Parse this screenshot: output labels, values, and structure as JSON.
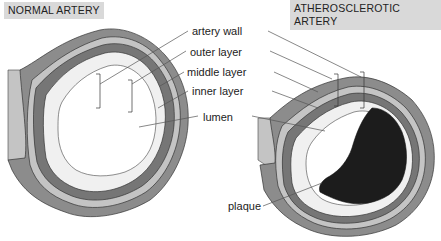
{
  "diagram": {
    "titles": {
      "left": "NORMAL ARTERY",
      "right": "ATHEROSCLEROTIC ARTERY"
    },
    "labels": {
      "artery_wall": "artery wall",
      "outer_layer": "outer layer",
      "middle_layer": "middle layer",
      "inner_layer": "inner layer",
      "lumen": "lumen",
      "plaque": "plaque"
    },
    "colors": {
      "outer_layer": "#8c8c8c",
      "middle_layer_light": "#c4c4c4",
      "middle_band_dark": "#767676",
      "inner_layer": "#f0f0f0",
      "lumen": "#ffffff",
      "plaque": "#1c1c1c",
      "title_bg": "#d9d9d9",
      "leader_line": "#555555"
    }
  }
}
